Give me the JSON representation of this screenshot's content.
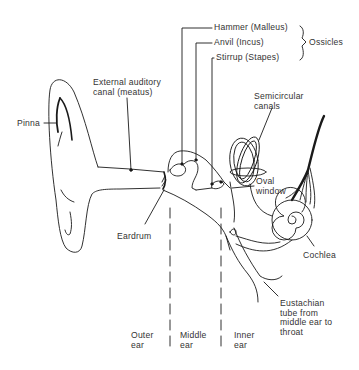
{
  "diagram": {
    "labels": {
      "hammer": "Hammer (Malleus)",
      "anvil": "Anvil (Incus)",
      "stirrup": "Stirrup (Stapes)",
      "ossicles": "Ossicles",
      "external_canal_1": "External auditory",
      "external_canal_2": "canal (meatus)",
      "pinna": "Pinna",
      "semicircular_1": "Semicircular",
      "semicircular_2": "canals",
      "oval_1": "Oval",
      "oval_2": "window",
      "eardrum": "Eardrum",
      "cochlea": "Cochlea",
      "eustachian_1": "Eustachian",
      "eustachian_2": "tube from",
      "eustachian_3": "middle ear to",
      "eustachian_4": "throat"
    },
    "regions": [
      {
        "line1": "Outer",
        "line2": "ear"
      },
      {
        "line1": "Middle",
        "line2": "ear"
      },
      {
        "line1": "Inner",
        "line2": "ear"
      }
    ],
    "colors": {
      "ink": "#1a1a1a",
      "background": "#ffffff"
    }
  }
}
